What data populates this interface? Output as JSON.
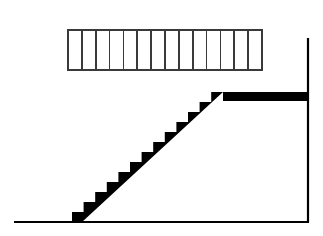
{
  "figure": {
    "background_color": "#ffffff",
    "ink_color": "#000000",
    "grid_stroke_color": "#3a3a3a",
    "width": 323,
    "height": 236
  },
  "count_strip": {
    "name": "step-count-strip",
    "cell_count": 14,
    "x": 68,
    "y": 30,
    "width": 194,
    "height": 40,
    "cell_width": 13.857,
    "stroke_width": 1.6,
    "fill": "#ffffff",
    "stroke": "#3a3a3a",
    "cells": [
      {
        "index": 1,
        "label": ""
      },
      {
        "index": 2,
        "label": ""
      },
      {
        "index": 3,
        "label": ""
      },
      {
        "index": 4,
        "label": ""
      },
      {
        "index": 5,
        "label": ""
      },
      {
        "index": 6,
        "label": ""
      },
      {
        "index": 7,
        "label": ""
      },
      {
        "index": 8,
        "label": ""
      },
      {
        "index": 9,
        "label": ""
      },
      {
        "index": 10,
        "label": ""
      },
      {
        "index": 11,
        "label": ""
      },
      {
        "index": 12,
        "label": ""
      },
      {
        "index": 13,
        "label": ""
      },
      {
        "index": 14,
        "label": ""
      }
    ]
  },
  "staircase": {
    "name": "staircase-silhouette",
    "fill": "#000000",
    "step_count": 13,
    "base_x": 72,
    "base_y": 222,
    "step_run": 11.6,
    "step_rise": 10.0,
    "top_x": 223,
    "top_y": 92,
    "underside_start_x": 82,
    "underside_start_y": 222
  },
  "landing": {
    "name": "top-landing-slab",
    "x": 223,
    "y": 92,
    "width": 86,
    "height": 9,
    "fill": "#000000"
  },
  "ground": {
    "name": "ground-line",
    "x1": 14,
    "y1": 222,
    "x2": 309,
    "y2": 222,
    "stroke": "#000000",
    "stroke_width": 2.2
  },
  "wall": {
    "name": "right-wall-line",
    "x1": 308,
    "y1": 38,
    "x2": 308,
    "y2": 222,
    "stroke": "#000000",
    "stroke_width": 2.2
  }
}
